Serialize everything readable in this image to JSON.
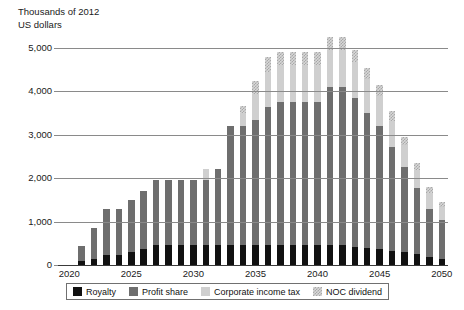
{
  "chart_data": {
    "type": "bar",
    "subtype": "stacked-column",
    "title": "",
    "ylabel": "Thousands of 2012\nUS dollars",
    "xlabel": "",
    "ylim": [
      0,
      5400
    ],
    "yticks": [
      0,
      1000,
      2000,
      3000,
      4000,
      5000
    ],
    "ytick_labels": [
      "0",
      "1,000",
      "2,000",
      "3,000",
      "4,000",
      "5,000"
    ],
    "xticks": [
      2020,
      2025,
      2030,
      2035,
      2040,
      2045,
      2050
    ],
    "xtick_labels": [
      "2020",
      "2025",
      "2030",
      "2035",
      "2040",
      "2045",
      "2050"
    ],
    "grid": true,
    "legend_position": "bottom",
    "categories": [
      2020,
      2021,
      2022,
      2023,
      2024,
      2025,
      2026,
      2027,
      2028,
      2029,
      2030,
      2031,
      2032,
      2033,
      2034,
      2035,
      2036,
      2037,
      2038,
      2039,
      2040,
      2041,
      2042,
      2043,
      2044,
      2045,
      2046,
      2047,
      2048,
      2049,
      2050
    ],
    "series": [
      {
        "name": "Royalty",
        "color": "#111111",
        "values": [
          0,
          90,
          150,
          220,
          220,
          300,
          380,
          450,
          450,
          450,
          450,
          450,
          450,
          450,
          450,
          450,
          450,
          450,
          450,
          450,
          450,
          450,
          450,
          420,
          400,
          370,
          330,
          290,
          250,
          180,
          140
        ]
      },
      {
        "name": "Profit share",
        "color": "#6e6e6e",
        "values": [
          0,
          340,
          700,
          1060,
          1060,
          1200,
          1320,
          1510,
          1510,
          1510,
          1510,
          1510,
          1770,
          2750,
          2750,
          2900,
          3200,
          3300,
          3300,
          3300,
          3300,
          3650,
          3650,
          3430,
          3100,
          2830,
          2380,
          1960,
          1530,
          1120,
          900
        ]
      },
      {
        "name": "Corporate income tax",
        "color": "#cfcfcf",
        "values": [
          0,
          0,
          0,
          0,
          0,
          0,
          0,
          0,
          0,
          0,
          0,
          260,
          0,
          0,
          300,
          600,
          800,
          850,
          850,
          850,
          850,
          850,
          850,
          820,
          780,
          700,
          620,
          520,
          420,
          350,
          300
        ]
      },
      {
        "name": "NOC dividend",
        "color": "#d8d8d8",
        "pattern": "checker",
        "values": [
          0,
          0,
          0,
          0,
          0,
          0,
          0,
          0,
          0,
          0,
          0,
          0,
          0,
          0,
          170,
          300,
          350,
          300,
          300,
          300,
          300,
          300,
          310,
          280,
          270,
          250,
          220,
          190,
          160,
          140,
          120
        ]
      }
    ]
  },
  "legend": {
    "items": [
      {
        "label": "Royalty"
      },
      {
        "label": "Profit share"
      },
      {
        "label": "Corporate income tax"
      },
      {
        "label": "NOC dividend"
      }
    ]
  }
}
